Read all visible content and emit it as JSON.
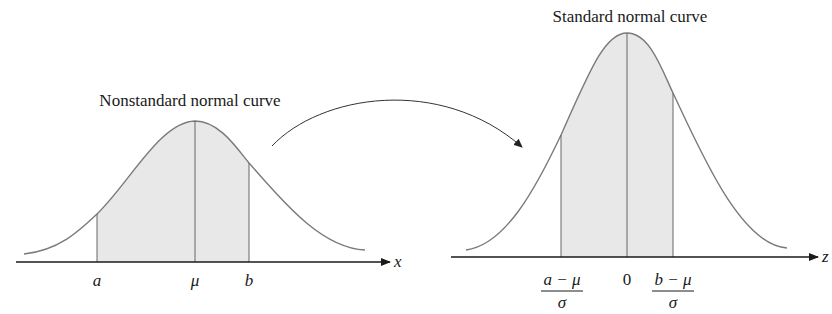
{
  "left_panel": {
    "title": "Nonstandard normal curve",
    "axis_label": "x",
    "tick_labels": {
      "a": "a",
      "mu": "μ",
      "b": "b"
    }
  },
  "right_panel": {
    "title": "Standard normal curve",
    "axis_label": "z",
    "tick_labels": {
      "lower_numerator": "a − μ",
      "lower_denominator": "σ",
      "zero": "0",
      "upper_numerator": "b − μ",
      "upper_denominator": "σ"
    }
  },
  "transform_arrow": {
    "direction": "left-to-right"
  },
  "colors": {
    "curve": "#7a7a7a",
    "shade": "#e6e6e6",
    "axis": "#1a1a1a",
    "arrow": "#333333"
  }
}
